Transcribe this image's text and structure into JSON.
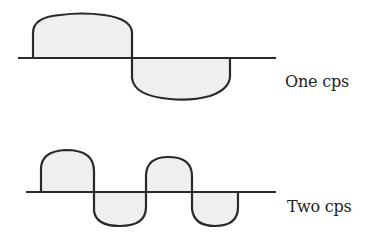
{
  "diagrams": [
    {
      "id": "one-cps",
      "label": "One cps",
      "cycles": 1,
      "baseline": {
        "x1": 18,
        "x2": 276,
        "y": 58
      },
      "lobes": [
        {
          "polarity": "positive",
          "x_start": 33,
          "x_end": 132,
          "peak_y": 15
        },
        {
          "polarity": "negative",
          "x_start": 132,
          "x_end": 230,
          "peak_y": 99
        }
      ]
    },
    {
      "id": "two-cps",
      "label": "Two cps",
      "cycles": 2,
      "baseline": {
        "x1": 26,
        "x2": 276,
        "y": 192
      },
      "lobes": [
        {
          "polarity": "positive",
          "x_start": 41,
          "x_end": 94,
          "peak_y": 150
        },
        {
          "polarity": "negative",
          "x_start": 94,
          "x_end": 146,
          "peak_y": 226
        },
        {
          "polarity": "positive",
          "x_start": 146,
          "x_end": 192,
          "peak_y": 157
        },
        {
          "polarity": "negative",
          "x_start": 192,
          "x_end": 238,
          "peak_y": 226
        }
      ]
    }
  ],
  "colors": {
    "stroke": "#2a2a2a",
    "fill": "#efefef",
    "text": "#222222"
  }
}
